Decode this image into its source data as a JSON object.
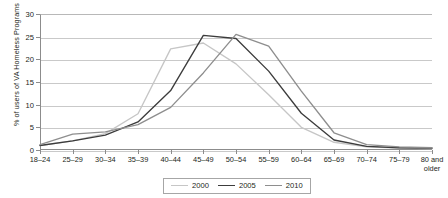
{
  "chart_data": {
    "type": "line",
    "title": "",
    "xlabel": "",
    "ylabel": "% of users of VA Homeless Programs",
    "ylim": [
      0,
      30
    ],
    "yticks": [
      0,
      5,
      10,
      15,
      20,
      25,
      30
    ],
    "grid": true,
    "legend_position": "bottom",
    "categories": [
      "18–24",
      "25–29",
      "30–34",
      "35–39",
      "40–44",
      "45–49",
      "50–54",
      "55–59",
      "60–64",
      "65–69",
      "70–74",
      "75–79",
      "80 and older"
    ],
    "series": [
      {
        "name": "2000",
        "color": "#c6c6c6",
        "values": [
          1.0,
          2.0,
          3.6,
          8.0,
          22.3,
          23.6,
          19.0,
          12.2,
          5.0,
          1.7,
          0.7,
          0.4,
          0.3
        ]
      },
      {
        "name": "2005",
        "color": "#3c3c3c",
        "values": [
          1.0,
          2.0,
          3.3,
          6.2,
          13.1,
          25.3,
          24.6,
          17.4,
          8.1,
          2.2,
          0.8,
          0.5,
          0.4
        ]
      },
      {
        "name": "2010",
        "color": "#8e8e8e",
        "values": [
          1.2,
          3.5,
          4.0,
          5.6,
          9.4,
          17.0,
          25.5,
          22.9,
          13.0,
          3.8,
          1.2,
          0.7,
          0.5
        ]
      }
    ]
  },
  "legend": {
    "entries": [
      {
        "label": "2000"
      },
      {
        "label": "2005"
      },
      {
        "label": "2010"
      }
    ]
  }
}
